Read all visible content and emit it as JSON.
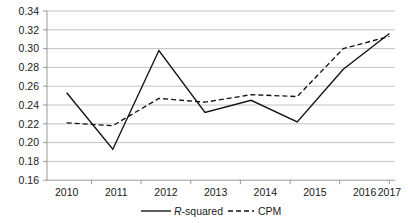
{
  "chart_data": {
    "type": "line",
    "title": "",
    "xlabel": "",
    "ylabel": "",
    "categories": [
      "2010",
      "2011",
      "2012",
      "2013",
      "2014",
      "2015",
      "2016",
      "2017"
    ],
    "x": [
      2010,
      2011,
      2012,
      2013,
      2014,
      2015,
      2016,
      2017
    ],
    "series": [
      {
        "name": "R-squared",
        "style": "solid",
        "color": "#111111",
        "values": [
          0.253,
          0.193,
          0.298,
          0.232,
          0.245,
          0.222,
          0.278,
          0.316
        ]
      },
      {
        "name": "CPM",
        "style": "dashed",
        "color": "#111111",
        "values": [
          0.221,
          0.218,
          0.247,
          0.243,
          0.251,
          0.249,
          0.3,
          0.313
        ]
      }
    ],
    "ylim": [
      0.16,
      0.34
    ],
    "ytick_step": 0.02,
    "ytick_labels": [
      "0.34",
      "0.32",
      "0.30",
      "0.28",
      "0.26",
      "0.24",
      "0.22",
      "0.20",
      "0.18",
      "0.16"
    ],
    "ytick_values": [
      0.34,
      0.32,
      0.3,
      0.28,
      0.26,
      0.24,
      0.22,
      0.2,
      0.18,
      0.16
    ],
    "grid": true,
    "grid_axis": "y",
    "legend_position": "bottom",
    "legend": [
      {
        "label_prefix": "R",
        "label_suffix": "-squared",
        "style": "solid"
      },
      {
        "label_prefix": "",
        "label_suffix": "CPM",
        "style": "dashed"
      }
    ]
  }
}
